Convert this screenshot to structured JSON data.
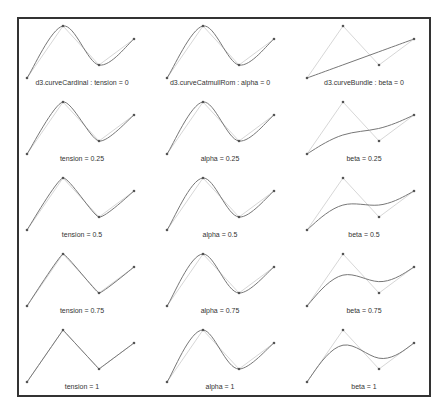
{
  "figure": {
    "colors": {
      "curve": "#777777",
      "control_polygon": "#cccccc",
      "points": "#555555",
      "frame": "#333333",
      "label": "#333333"
    },
    "control_points": [
      [
        0,
        52
      ],
      [
        36,
        0
      ],
      [
        72,
        39
      ],
      [
        107,
        13
      ]
    ],
    "columns": [
      {
        "curve": "cardinal",
        "x_offset": 27,
        "label_x": 82,
        "panels": [
          {
            "param": 0,
            "label": "d3.curveCardinal : tension = 0"
          },
          {
            "param": 0.25,
            "label": "tension = 0.25"
          },
          {
            "param": 0.5,
            "label": "tension = 0.5"
          },
          {
            "param": 0.75,
            "label": "tension = 0.75"
          },
          {
            "param": 1,
            "label": "tension = 1"
          }
        ]
      },
      {
        "curve": "catmullRom",
        "x_offset": 167,
        "label_x": 220,
        "panels": [
          {
            "param": 0,
            "label": "d3.curveCatmullRom : alpha = 0"
          },
          {
            "param": 0.25,
            "label": "alpha = 0.25"
          },
          {
            "param": 0.5,
            "label": "alpha = 0.5"
          },
          {
            "param": 0.75,
            "label": "alpha = 0.75"
          },
          {
            "param": 1,
            "label": "alpha = 1"
          }
        ]
      },
      {
        "curve": "bundle",
        "x_offset": 307,
        "label_x": 364,
        "panels": [
          {
            "param": 0,
            "label": "d3.curveBundle : beta = 0"
          },
          {
            "param": 0.25,
            "label": "beta = 0.25"
          },
          {
            "param": 0.5,
            "label": "beta = 0.5"
          },
          {
            "param": 0.75,
            "label": "beta = 0.75"
          },
          {
            "param": 1,
            "label": "beta = 1"
          }
        ]
      }
    ],
    "row_top": 26,
    "row_spacing": 76,
    "label_dy": 59
  }
}
